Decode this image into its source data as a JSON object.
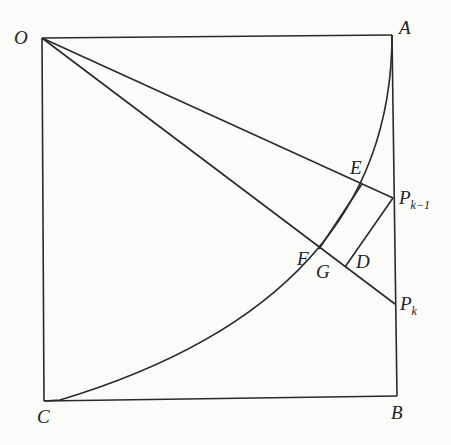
{
  "diagram": {
    "type": "geometry",
    "points": {
      "O": {
        "label": "O",
        "x": 42,
        "y": 38
      },
      "A": {
        "label": "A",
        "x": 392,
        "y": 35
      },
      "B": {
        "label": "B",
        "x": 397,
        "y": 396
      },
      "C": {
        "label": "C",
        "x": 44,
        "y": 401
      },
      "E": {
        "label": "E",
        "x": 362,
        "y": 184
      },
      "P_k_minus_1": {
        "label": "P",
        "sub": "k−1",
        "x": 393,
        "y": 198
      },
      "P_k": {
        "label": "P",
        "sub": "k",
        "x": 395,
        "y": 304
      },
      "D": {
        "label": "D",
        "x": 345,
        "y": 267
      },
      "F": {
        "label": "F",
        "x": 323,
        "y": 252
      },
      "G": {
        "label": "G",
        "x": 327,
        "y": 255
      }
    },
    "labels": {
      "O": "O",
      "A": "A",
      "B": "B",
      "C": "C",
      "E": "E",
      "F": "F",
      "G": "G",
      "D": "D",
      "P1": "P",
      "P1_sub": "k−1",
      "P2": "P",
      "P2_sub": "k"
    },
    "stroke_color": "#2a2a2a",
    "background": "#fbfbf9"
  }
}
